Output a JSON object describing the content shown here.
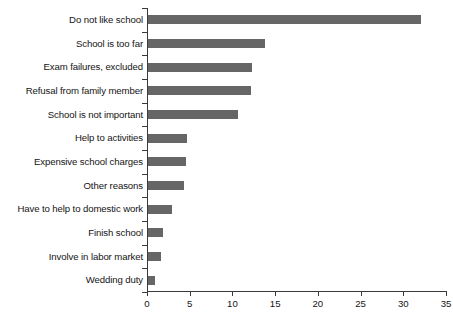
{
  "chart_data": {
    "type": "bar",
    "orientation": "horizontal",
    "title": "",
    "subtitle": "",
    "xlabel": "",
    "ylabel": "",
    "xlim": [
      0,
      35
    ],
    "ylim": null,
    "grid": false,
    "legend": null,
    "legend_position": "none",
    "bar_color": "#666666",
    "axis_color": "#3a3a3a",
    "background_color": "#ffffff",
    "xticks": [
      0,
      5,
      10,
      15,
      20,
      25,
      30,
      35
    ],
    "xtick_labels": [
      "0",
      "5",
      "10",
      "15",
      "20",
      "25",
      "30",
      "35"
    ],
    "categories": [
      "Do not like school",
      "School is too far",
      "Exam failures, excluded",
      "Refusal from family member",
      "School is not important",
      "Help to activities",
      "Expensive school charges",
      "Other reasons",
      "Have to help to domestic work",
      "Finish school",
      "Involve in labor market",
      "Wedding duty"
    ],
    "values": [
      32,
      13.7,
      12.2,
      12,
      10.5,
      4.6,
      4.4,
      4.2,
      2.8,
      1.8,
      1.5,
      0.8
    ]
  }
}
